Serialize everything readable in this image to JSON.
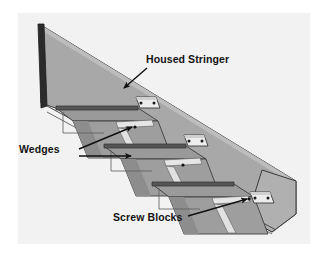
{
  "figure": {
    "panel": {
      "background_color": "#f2f2f2",
      "margin_color": "#ffffff"
    },
    "palette": {
      "stringer_face": "#a8a8a8",
      "stringer_face_light": "#b4b4b4",
      "stringer_edge_dark": "#2b2b2b",
      "tread_top": "#9a9a9a",
      "tread_nosing": "#565656",
      "riser_face": "#9e9e9e",
      "riser_shadow": "#8a8a8a",
      "wedge_light": "#e6e6e6",
      "screw_block": "#ededed",
      "screw_dot": "#1a1a1a",
      "outline": "#3a3a3a",
      "leader_line": "#111111",
      "label_text": "#141414"
    },
    "labels": [
      {
        "id": "housed-stringer",
        "text": "Housed Stringer",
        "text_x": 146,
        "text_y": 63,
        "anchor": "start"
      },
      {
        "id": "wedges",
        "text": "Wedges",
        "text_x": 19,
        "text_y": 153,
        "anchor": "start"
      },
      {
        "id": "screw-blocks",
        "text": "Screw Blocks",
        "text_x": 113,
        "text_y": 221,
        "anchor": "start"
      }
    ],
    "leaders": [
      {
        "id": "leader-housed-stringer",
        "from_label": "housed-stringer",
        "path": "M 147 68 L 124 88",
        "arrow_at": "124,88",
        "arrow_angle": 221
      },
      {
        "id": "leader-wedge-upper",
        "from_label": "wedges",
        "path": "M 79 149 L 134 127",
        "arrow_at": "134,127",
        "arrow_angle": 338
      },
      {
        "id": "leader-wedge-lower",
        "from_label": "wedges",
        "path": "M 79 156 L 134 156",
        "arrow_at": "134,156",
        "arrow_angle": 0
      },
      {
        "id": "leader-screw-blocks",
        "from_label": "screw-blocks",
        "path": "M 188 216 L 250 199",
        "arrow_at": "250,199",
        "arrow_angle": 345
      }
    ],
    "parts": {
      "stringer": {
        "name": "Housed Stringer",
        "description": "Long sloping board with housed mortises receiving treads and risers"
      },
      "wedges": {
        "name": "Wedges",
        "count": 6,
        "description": "Thin tapered strips driven into the housings to lock treads and risers"
      },
      "screw_blocks": {
        "name": "Screw Blocks",
        "count": 3,
        "description": "Small blocks screwed into the tread/riser junction for rigidity"
      },
      "treads": {
        "name": "Treads",
        "count": 3
      },
      "risers": {
        "name": "Risers",
        "count": 3
      }
    }
  }
}
